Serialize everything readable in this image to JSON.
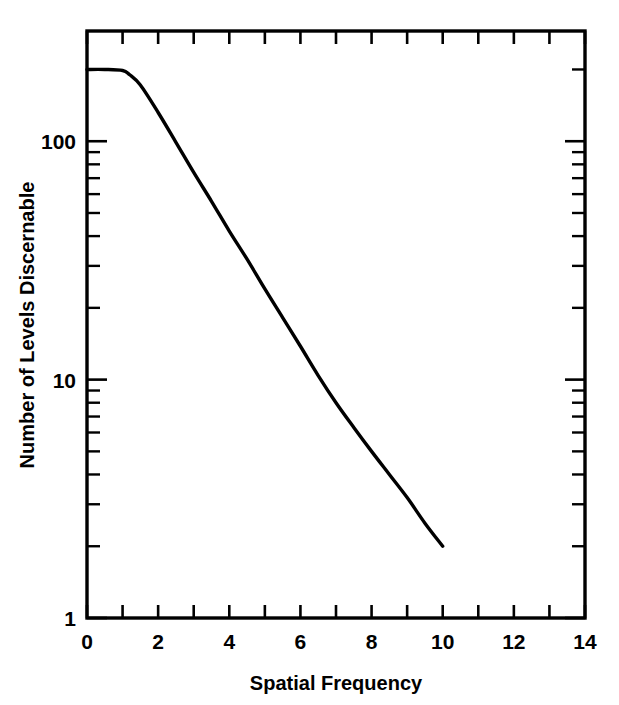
{
  "chart_data": {
    "type": "line",
    "title": "",
    "subtitle": "",
    "xlabel": "Spatial Frequency",
    "ylabel": "Number of Levels Discernable",
    "xscale": "linear",
    "yscale": "log",
    "xlim": [
      0,
      14
    ],
    "ylim": [
      1,
      290
    ],
    "grid": false,
    "legend": null,
    "legend_position": "none",
    "xticks": [
      0,
      1,
      2,
      3,
      4,
      5,
      6,
      7,
      8,
      9,
      10,
      11,
      12,
      13,
      14
    ],
    "xtick_labels": [
      "0",
      "",
      "2",
      "",
      "4",
      "",
      "6",
      "",
      "8",
      "",
      "10",
      "",
      "12",
      "",
      "14"
    ],
    "xtick_labels_shown": [
      "0",
      "2",
      "4",
      "6",
      "8",
      "10",
      "12",
      "14"
    ],
    "yticks_major": [
      1,
      10,
      100
    ],
    "ytick_labels": [
      "1",
      "10",
      "100"
    ],
    "yticks_minor": [
      2,
      3,
      4,
      5,
      6,
      7,
      8,
      9,
      20,
      30,
      40,
      50,
      60,
      70,
      80,
      90,
      200
    ],
    "series": [
      {
        "name": "Levels Discernable",
        "color": "#000000",
        "x": [
          0.0,
          0.5,
          1.0,
          1.2,
          1.5,
          2.0,
          2.5,
          3.0,
          3.5,
          4.0,
          4.5,
          5.0,
          5.5,
          6.0,
          6.5,
          7.0,
          7.5,
          8.0,
          8.5,
          9.0,
          9.5,
          10.0
        ],
        "y": [
          200,
          200,
          198,
          190,
          172,
          132,
          99,
          74,
          56,
          42,
          32,
          24,
          18.2,
          13.8,
          10.4,
          8.0,
          6.3,
          5.0,
          4.0,
          3.2,
          2.5,
          2.0
        ]
      }
    ]
  },
  "axes": {
    "x_axis_label": "Spatial Frequency",
    "y_axis_label": "Number of Levels Discernable"
  }
}
